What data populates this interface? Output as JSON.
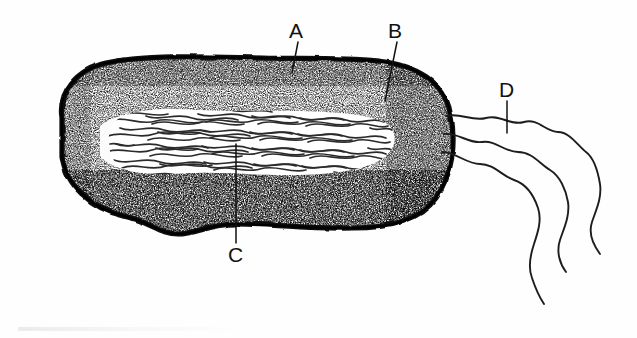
{
  "figure": {
    "background_color": "#ffffff",
    "ink_color": "#111111",
    "style": "black-and-white stippled scientific illustration",
    "labels": [
      {
        "id": "A",
        "text": "A",
        "x": 296,
        "y": 30,
        "leader_to_x": 292,
        "leader_to_y": 72,
        "points_at": "cell-envelope-outer-boundary"
      },
      {
        "id": "B",
        "text": "B",
        "x": 395,
        "y": 30,
        "leader_to_x": 385,
        "leader_to_y": 101,
        "points_at": "stippled-cytoplasm"
      },
      {
        "id": "C",
        "text": "C",
        "x": 235,
        "y": 254,
        "leader_to_x": 236,
        "leader_to_y": 144,
        "points_at": "nucleoid-dna-fibrils"
      },
      {
        "id": "D",
        "text": "D",
        "x": 506,
        "y": 89,
        "leader_to_x": 506,
        "leader_to_y": 133,
        "points_at": "flagella"
      }
    ],
    "parts": [
      {
        "name": "cell-wall",
        "description": "thick black outer boundary of the rod-shaped cell"
      },
      {
        "name": "cytoplasm",
        "description": "dense stippled region between wall and nucleoid"
      },
      {
        "name": "nucleoid",
        "description": "pale central region filled with wavy DNA fibrils"
      },
      {
        "name": "flagella",
        "description": "three long wavy filaments emerging from the right pole"
      }
    ],
    "flagella_count": 3,
    "cell_bounds": {
      "x": 45,
      "y": 55,
      "width": 410,
      "height": 180
    }
  }
}
